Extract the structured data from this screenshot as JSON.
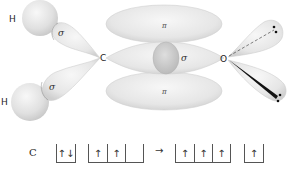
{
  "diagram": {
    "atoms": {
      "h_top": "H",
      "h_bottom": "H",
      "carbon": "C",
      "oxygen": "O"
    },
    "bond_labels": {
      "sigma_ch_top": "σ",
      "sigma_ch_bottom": "σ",
      "sigma_co": "σ",
      "pi_top": "π",
      "pi_bottom": "π"
    },
    "colors": {
      "orbital_fill": "#e4e4e4",
      "orbital_edge": "#c8c8c8",
      "sphere_fill": "#d6d6d6",
      "bond_line": "#111111",
      "text": "#222222"
    }
  },
  "electron_configuration": {
    "element": "C",
    "arrow": "→",
    "ground_state": {
      "s_box": [
        "↑↓"
      ],
      "p_boxes": [
        "↑",
        "↑",
        ""
      ]
    },
    "hybridized_state": {
      "sp2_boxes": [
        "↑",
        "↑",
        "↑"
      ],
      "p_box": [
        "↑"
      ]
    }
  }
}
